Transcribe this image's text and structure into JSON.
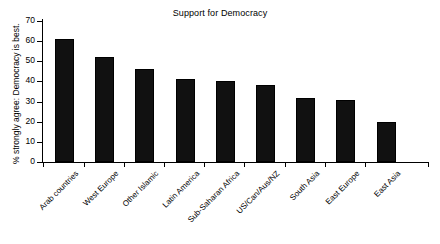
{
  "chart_data": {
    "type": "bar",
    "title": "Support for Democracy",
    "xlabel": "",
    "ylabel": "% strongly agree: Democracy is best.",
    "ylim": [
      0,
      70
    ],
    "yticks": [
      0,
      10,
      20,
      30,
      40,
      50,
      60,
      70
    ],
    "ytick_labels": [
      "0",
      "10",
      "20",
      "30",
      "40",
      "50",
      "60",
      "70"
    ],
    "grid": false,
    "legend": false,
    "bar_color": "#111111",
    "background": "#ffffff",
    "categories": [
      "Arab countries",
      "West Europe",
      "Other Islamic",
      "Latin America",
      "Sub-Saharan Africa",
      "US/Can/Aus/NZ",
      "South Asia",
      "East Europe",
      "East Asia"
    ],
    "values": [
      61,
      52,
      46,
      41,
      40,
      38,
      32,
      31,
      20
    ],
    "series": [
      {
        "name": "% strongly agree: Democracy is best.",
        "values": [
          61,
          52,
          46,
          41,
          40,
          38,
          32,
          31,
          20
        ]
      }
    ]
  }
}
